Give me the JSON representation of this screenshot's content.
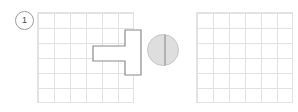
{
  "page": {
    "background": "#ffffff",
    "width": 298,
    "height": 112
  },
  "question": {
    "number": "1",
    "badge_shape": "circle",
    "badge_color": "#9b9b9b"
  },
  "grids": [
    {
      "id": "left",
      "role": "shape-grid",
      "columns": 6,
      "rows": 6,
      "cell_width": 16,
      "cell_height": 15,
      "line_color": "#dfe3e6",
      "empty": false
    },
    {
      "id": "right",
      "role": "answer-grid",
      "columns": 6,
      "rows": 6,
      "cell_width": 16,
      "cell_height": 15,
      "line_color": "#dfe3e6",
      "empty": true
    }
  ],
  "shape": {
    "name": "t-shaped-polygon",
    "stroke_color": "#8a8a8a",
    "fill_color": "#ffffff",
    "stroke_width": 1.2,
    "grid_cells": "horizontal-bar 2x1 plus vertical-bar 1x3",
    "points": "56,34 88,34 88,18 104,18 104,63 88,63 88,49 56,49"
  },
  "sphere": {
    "name": "shaded-sphere-with-axis",
    "fill_color": "#dedede",
    "edge_color": "#c3c3c3",
    "axis_color": "#8d8d8d",
    "radius": 16,
    "axis_offset_x": 2
  }
}
